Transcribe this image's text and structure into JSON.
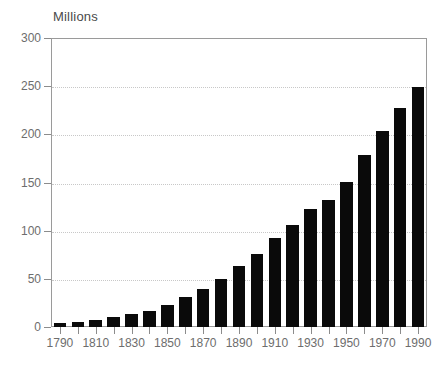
{
  "chart_data": {
    "type": "bar",
    "title": "",
    "ylabel": "Millions",
    "xlabel": "",
    "ylim": [
      0,
      300
    ],
    "ytick_labels": [
      "0",
      "50",
      "100",
      "150",
      "200",
      "250",
      "300"
    ],
    "ytick_values": [
      0,
      50,
      100,
      150,
      200,
      250,
      300
    ],
    "xtick_labels": [
      "1790",
      "1810",
      "1830",
      "1850",
      "1870",
      "1890",
      "1910",
      "1930",
      "1950",
      "1970",
      "1990"
    ],
    "grid": true,
    "legend": "none",
    "bar_color": "#0a0a0a",
    "categories": [
      "1790",
      "1800",
      "1810",
      "1820",
      "1830",
      "1840",
      "1850",
      "1860",
      "1870",
      "1880",
      "1890",
      "1900",
      "1910",
      "1920",
      "1930",
      "1940",
      "1950",
      "1960",
      "1970",
      "1980",
      "1990"
    ],
    "values": [
      4,
      5,
      7,
      10,
      13,
      17,
      23,
      31,
      39,
      50,
      63,
      76,
      92,
      106,
      123,
      132,
      151,
      179,
      203,
      227,
      249
    ]
  },
  "axis": {
    "title": "Millions"
  },
  "colors": {
    "bar": "#0a0a0a",
    "grid": "#c8c8c8",
    "frame": "#9a9a9a",
    "text": "#6d6d6d",
    "background": "#ffffff"
  }
}
